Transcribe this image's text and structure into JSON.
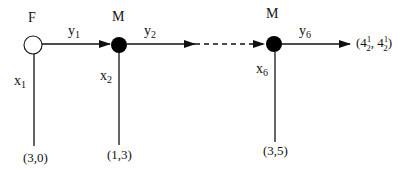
{
  "diagram": {
    "type": "game-tree",
    "nodes": [
      {
        "id": "n1",
        "player": "F",
        "style": "open",
        "label": "F"
      },
      {
        "id": "n2",
        "player": "M",
        "style": "filled",
        "label": "M"
      },
      {
        "id": "n6",
        "player": "M",
        "style": "filled",
        "label": "M"
      }
    ],
    "edges": {
      "continue": [
        {
          "from": "n1",
          "to": "n2",
          "var": "y",
          "sub": "1",
          "style": "solid"
        },
        {
          "from": "n2",
          "to": "n6",
          "var": "y",
          "sub": "2",
          "style": "solid-then-dashed"
        },
        {
          "from": "n6",
          "to": "end",
          "var": "y",
          "sub": "6",
          "style": "solid"
        }
      ],
      "stop": [
        {
          "from": "n1",
          "var": "x",
          "sub": "1",
          "payoff": "(3,0)"
        },
        {
          "from": "n2",
          "var": "x",
          "sub": "2",
          "payoff": "(1,3)"
        },
        {
          "from": "n6",
          "var": "x",
          "sub": "6",
          "payoff": "(3,5)"
        }
      ]
    },
    "terminal_payoff": {
      "open": "(4",
      "sup1": "1",
      "sub1": "2",
      "sep": ", 4",
      "sup2": "1",
      "sub2": "2",
      "close": ")"
    },
    "colors": {
      "line": "#111111",
      "node_fill": "#000000",
      "open_fill": "#ffffff"
    }
  }
}
